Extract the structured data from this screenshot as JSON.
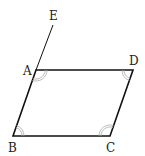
{
  "diagram": {
    "type": "geometry-figure",
    "shape": "parallelogram",
    "points": {
      "A": {
        "label": "A",
        "x": 36,
        "y": 70
      },
      "B": {
        "label": "B",
        "x": 13,
        "y": 136
      },
      "C": {
        "label": "C",
        "x": 110,
        "y": 136
      },
      "D": {
        "label": "D",
        "x": 133,
        "y": 70
      },
      "E": {
        "label": "E",
        "x": 53,
        "y": 25
      }
    },
    "labels": {
      "A": "A",
      "B": "B",
      "C": "C",
      "D": "D",
      "E": "E"
    },
    "segments": [
      "AB",
      "BC",
      "CD",
      "DA",
      "AE"
    ],
    "angle_marks": [
      "EAD",
      "ABC",
      "BCD",
      "CDA"
    ],
    "colors": {
      "stroke": "#111111",
      "angle_mark": "#aaaaaa",
      "label": "#222222"
    }
  }
}
